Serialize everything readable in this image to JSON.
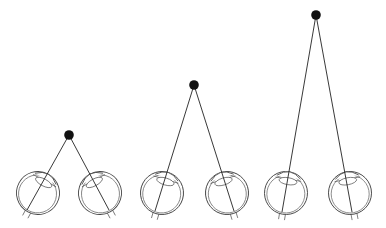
{
  "figure": {
    "colors": {
      "line": "#222222",
      "target": "#111111",
      "outline": "#444444",
      "background": "#ffffff"
    },
    "scenarios": [
      {
        "name": "near-target",
        "relative_distance": "near",
        "convergence": "strong"
      },
      {
        "name": "medium-target",
        "relative_distance": "medium",
        "convergence": "moderate"
      },
      {
        "name": "far-target",
        "relative_distance": "far",
        "convergence": "slight"
      }
    ],
    "icons": {
      "target": "target-dot-icon",
      "eye": "eyeball-icon"
    }
  }
}
